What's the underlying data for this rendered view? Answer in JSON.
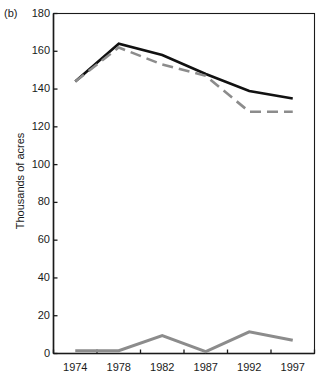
{
  "panel": {
    "label": "(b)"
  },
  "chart_data": {
    "type": "line",
    "title": "",
    "xlabel": "",
    "ylabel": "Thousands of acres",
    "categories": [
      "1974",
      "1978",
      "1982",
      "1987",
      "1992",
      "1997"
    ],
    "ylim": [
      0,
      180
    ],
    "yticks": [
      0,
      20,
      40,
      60,
      80,
      100,
      120,
      140,
      160,
      180
    ],
    "ytick_labels": [
      "0",
      "20",
      "40",
      "60",
      "80",
      "100",
      "120",
      "140",
      "160",
      "180"
    ],
    "grid": false,
    "legend": "none",
    "series": [
      {
        "name": "total-solid-black",
        "style": "solid",
        "color": "#111111",
        "width": 2.6,
        "values": [
          144,
          164,
          158,
          148,
          139,
          135
        ]
      },
      {
        "name": "harvested-dashed-gray",
        "style": "dashed",
        "color": "#8c8c8c",
        "width": 2.6,
        "values": [
          144,
          162,
          153,
          147,
          128,
          128
        ]
      },
      {
        "name": "idle-solid-gray",
        "style": "solid",
        "color": "#8c8c8c",
        "width": 3.0,
        "values": [
          1.5,
          1.5,
          9.5,
          1.0,
          11.5,
          7.0
        ]
      }
    ]
  },
  "axes": {
    "frame_color": "#1a1a1a",
    "tick_color": "#1a1a1a"
  }
}
